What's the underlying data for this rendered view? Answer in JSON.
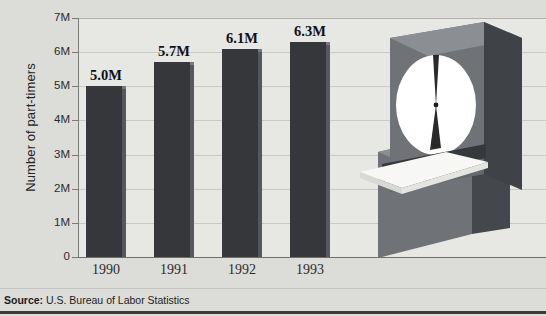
{
  "chart_data": {
    "type": "bar",
    "title": "",
    "subtitle": "",
    "xlabel": "",
    "ylabel": "Number of part-timers",
    "categories": [
      "1990",
      "1991",
      "1992",
      "1993"
    ],
    "values": [
      5.0,
      5.7,
      6.1,
      6.3
    ],
    "value_labels": [
      "5.0M",
      "5.7M",
      "6.1M",
      "6.3M"
    ],
    "units": "millions",
    "ylim": [
      0,
      7
    ],
    "ytick_values": [
      0,
      1,
      2,
      3,
      4,
      5,
      6,
      7
    ],
    "ytick_labels": [
      "0",
      "1M",
      "2M",
      "3M",
      "4M",
      "5M",
      "6M",
      "7M"
    ],
    "grid": true,
    "legend": null,
    "legend_position": "none",
    "bar_color": "#35373a",
    "plot_background": "#e7e7e4",
    "figure_background": "#dcdcd8"
  },
  "footer": {
    "source_label": "Source:",
    "source_text": "U.S. Bureau of Labor Statistics"
  },
  "illustration": {
    "name": "time-clock",
    "description": "punch time clock with clock face and timecard",
    "face_color": "#ffffff",
    "body_color": "#6f7276",
    "body_top_color": "#8b8e92",
    "body_side_color": "#3f4246",
    "card_color": "#f4f4f2"
  }
}
